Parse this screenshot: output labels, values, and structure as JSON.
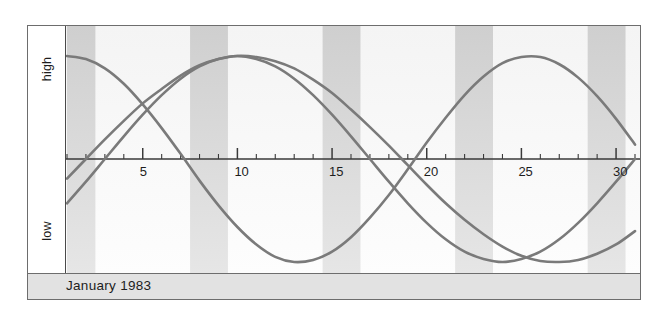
{
  "figure": {
    "caption": "January 1983",
    "axis_labels": {
      "high": "high",
      "low": "low"
    }
  },
  "chart_data": {
    "type": "line",
    "title": "January 1983",
    "subtitle": "",
    "xlabel": "",
    "ylabel": "",
    "x": [
      1,
      2,
      3,
      4,
      5,
      6,
      7,
      8,
      9,
      10,
      11,
      12,
      13,
      14,
      15,
      16,
      17,
      18,
      19,
      20,
      21,
      22,
      23,
      24,
      25,
      26,
      27,
      28,
      29,
      30,
      31
    ],
    "xlim": [
      1,
      31
    ],
    "ylim": [
      -1,
      1
    ],
    "xticks": [
      1,
      2,
      3,
      4,
      5,
      6,
      7,
      8,
      9,
      10,
      11,
      12,
      13,
      14,
      15,
      16,
      17,
      18,
      19,
      20,
      21,
      22,
      23,
      24,
      25,
      26,
      27,
      28,
      29,
      30,
      31
    ],
    "xtick_labels": [
      "5",
      "10",
      "15",
      "20",
      "25",
      "30"
    ],
    "xtick_label_positions": [
      5,
      10,
      15,
      20,
      25,
      30
    ],
    "ytick_labels": [
      "high",
      "low"
    ],
    "grid": false,
    "legend": "none",
    "zero_line": 0,
    "bands_label": "weekend shading",
    "bands": [
      {
        "start": 1,
        "end": 2.5
      },
      {
        "start": 7.5,
        "end": 9.5
      },
      {
        "start": 14.5,
        "end": 16.5
      },
      {
        "start": 21.5,
        "end": 23.5
      },
      {
        "start": 28.5,
        "end": 30.5
      }
    ],
    "series": [
      {
        "name": "physical",
        "period_days": 23,
        "color": "#7a7a7a",
        "values": [
          1.0,
          0.97,
          0.88,
          0.73,
          0.53,
          0.3,
          0.05,
          -0.21,
          -0.45,
          -0.66,
          -0.83,
          -0.95,
          -1.0,
          -0.98,
          -0.9,
          -0.76,
          -0.57,
          -0.35,
          -0.1,
          0.16,
          0.4,
          0.62,
          0.8,
          0.93,
          0.99,
          0.99,
          0.92,
          0.79,
          0.61,
          0.39,
          0.14
        ]
      },
      {
        "name": "emotional",
        "period_days": 28,
        "color": "#7a7a7a",
        "values": [
          -0.43,
          -0.22,
          0.0,
          0.22,
          0.43,
          0.62,
          0.78,
          0.9,
          0.97,
          1.0,
          0.97,
          0.9,
          0.78,
          0.62,
          0.43,
          0.22,
          0.0,
          -0.22,
          -0.43,
          -0.62,
          -0.78,
          -0.9,
          -0.97,
          -1.0,
          -0.97,
          -0.9,
          -0.78,
          -0.62,
          -0.43,
          -0.22,
          0.0
        ]
      },
      {
        "name": "intellectual",
        "period_days": 33,
        "color": "#7a7a7a",
        "values": [
          -0.19,
          0.0,
          0.19,
          0.37,
          0.54,
          0.68,
          0.81,
          0.91,
          0.97,
          1.0,
          0.99,
          0.95,
          0.88,
          0.77,
          0.64,
          0.48,
          0.31,
          0.13,
          -0.06,
          -0.25,
          -0.43,
          -0.59,
          -0.73,
          -0.85,
          -0.94,
          -0.99,
          -1.0,
          -0.98,
          -0.92,
          -0.83,
          -0.7
        ]
      }
    ]
  }
}
